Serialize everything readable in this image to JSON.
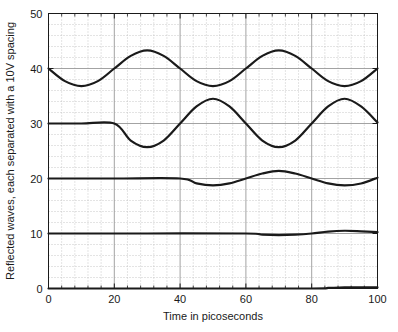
{
  "chart_data": {
    "type": "line",
    "title": "",
    "xlabel": "Time in picoseconds",
    "ylabel": "Reflected waves, each separated with a 10V spacing",
    "xlim": [
      0,
      100
    ],
    "ylim": [
      0,
      50
    ],
    "xticks": [
      0,
      20,
      40,
      60,
      80,
      100
    ],
    "yticks": [
      0,
      10,
      20,
      30,
      40,
      50
    ],
    "xtick_labels": [
      "0",
      "20",
      "40",
      "60",
      "80",
      "100"
    ],
    "ytick_labels": [
      "0",
      "10",
      "20",
      "30",
      "40",
      "50"
    ],
    "x_minor_step": 4,
    "y_minor_step": 2,
    "grid": {
      "major": true,
      "minor": true,
      "major_color": "#999999",
      "minor_color": "#bbbbbb",
      "minor_style": "dotted"
    },
    "legend": null,
    "line_color": "#1a1a1a",
    "line_width": 2.2,
    "series": [
      {
        "name": "wave-1-offset-40",
        "offset": 40,
        "delay": 0,
        "amplitude": 3.25,
        "period": 40,
        "comment": "full cosine from t=0, min 36.8 at t=10, max 43.3 at t=30 and t=70, min at t=50 and t=90, ends at 40 at t=100",
        "points_x": [
          0,
          5,
          10,
          15,
          20,
          25,
          30,
          35,
          40,
          45,
          50,
          55,
          60,
          65,
          70,
          75,
          80,
          85,
          90,
          95,
          100
        ],
        "points_y": [
          40.0,
          37.7,
          36.8,
          37.7,
          40.0,
          42.3,
          43.3,
          42.3,
          40.0,
          37.7,
          36.8,
          37.7,
          40.0,
          42.3,
          43.3,
          42.3,
          40.0,
          37.7,
          36.8,
          37.7,
          40.0
        ]
      },
      {
        "name": "wave-2-offset-30",
        "offset": 30,
        "delay": 20,
        "amplitude": 4.3,
        "period": 40,
        "comment": "flat at 30 until t=20, then sinusoid: min 25.7 at t=30, max 34.5 at t=50, min 25.7 at t=70, max 34.5 at t=90, ends 30.3 at t=100",
        "points_x": [
          0,
          10,
          20,
          25,
          30,
          35,
          40,
          45,
          50,
          55,
          60,
          65,
          70,
          75,
          80,
          85,
          90,
          95,
          100
        ],
        "points_y": [
          30.0,
          30.0,
          30.0,
          26.9,
          25.7,
          26.9,
          30.0,
          33.1,
          34.5,
          33.1,
          30.0,
          26.9,
          25.7,
          26.9,
          30.0,
          33.1,
          34.5,
          33.1,
          30.2
        ]
      },
      {
        "name": "wave-3-offset-20",
        "offset": 20,
        "delay": 40,
        "amplitude": 1.35,
        "period": 40,
        "comment": "flat at 20 until t=40, then small sinusoid: min 18.8 at t=50, max 21.5 at t=70, min 18.8 at t=90, ends 20.2 at t=100",
        "points_x": [
          0,
          20,
          40,
          45,
          50,
          55,
          60,
          65,
          70,
          75,
          80,
          85,
          90,
          95,
          100
        ],
        "points_y": [
          20.0,
          20.0,
          20.0,
          19.1,
          18.75,
          19.1,
          20.0,
          20.9,
          21.4,
          20.9,
          20.0,
          19.1,
          18.75,
          19.1,
          20.15
        ]
      },
      {
        "name": "wave-4-offset-10",
        "offset": 10,
        "delay": 60,
        "amplitude": 0.45,
        "period": 40,
        "comment": "flat at 10 until t=60, then tiny ripple: min 9.7 at t=70, max 10.5 at t=90, ends 10.3 at t=100",
        "points_x": [
          0,
          30,
          60,
          65,
          70,
          75,
          80,
          85,
          90,
          95,
          100
        ],
        "points_y": [
          10.0,
          10.0,
          10.0,
          9.78,
          9.7,
          9.78,
          10.0,
          10.35,
          10.5,
          10.4,
          10.25
        ]
      },
      {
        "name": "wave-5-offset-0",
        "offset": 0,
        "delay": 80,
        "amplitude": 0.18,
        "period": 40,
        "comment": "flat at 0 across the whole range with a barely visible bump after t=80",
        "points_x": [
          0,
          40,
          80,
          85,
          90,
          95,
          100
        ],
        "points_y": [
          0.0,
          0.0,
          0.0,
          0.1,
          0.2,
          0.22,
          0.2
        ]
      }
    ]
  },
  "axes": {
    "x_axis_label": "Time in picoseconds",
    "y_axis_label": "Reflected waves, each separated with a 10V spacing"
  }
}
